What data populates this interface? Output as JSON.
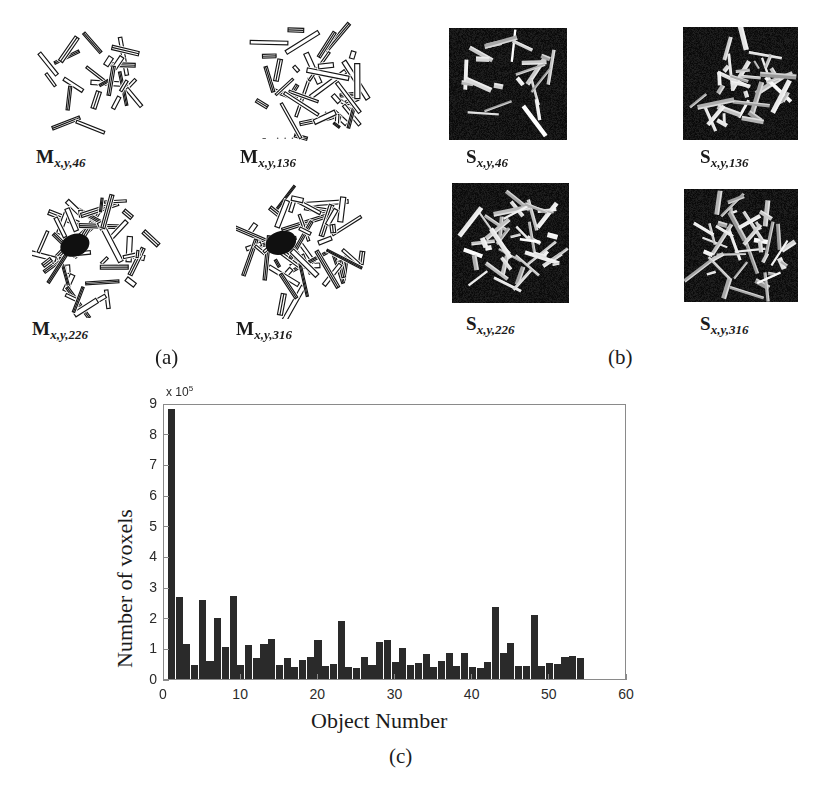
{
  "figure": {
    "panel_a": {
      "letter": "(a)",
      "tiles": [
        {
          "symbol": "M",
          "subscript": "x,y,46",
          "name": "mask-slice-46",
          "seed": 46,
          "density": 0.22,
          "x": 36,
          "y": 28,
          "w": 110,
          "h": 110
        },
        {
          "symbol": "M",
          "subscript": "x,y,136",
          "name": "mask-slice-136",
          "seed": 136,
          "density": 0.55,
          "x": 242,
          "y": 18,
          "w": 130,
          "h": 130
        },
        {
          "symbol": "M",
          "subscript": "x,y,226",
          "name": "mask-slice-226",
          "seed": 226,
          "density": 0.72,
          "x": 32,
          "y": 188,
          "w": 130,
          "h": 130
        },
        {
          "symbol": "M",
          "subscript": "x,y,316",
          "name": "mask-slice-316",
          "seed": 316,
          "density": 0.78,
          "x": 236,
          "y": 183,
          "w": 136,
          "h": 136
        }
      ]
    },
    "panel_b": {
      "letter": "(b)",
      "tiles": [
        {
          "symbol": "S",
          "subscript": "x,y,46",
          "name": "seg-slice-46",
          "seed": 460,
          "density": 0.18,
          "x": 449,
          "y": 28,
          "w": 118,
          "h": 112
        },
        {
          "symbol": "S",
          "subscript": "x,y,136",
          "name": "seg-slice-136",
          "seed": 1360,
          "density": 0.5,
          "x": 683,
          "y": 27,
          "w": 115,
          "h": 113
        },
        {
          "symbol": "S",
          "subscript": "x,y,226",
          "name": "seg-slice-226",
          "seed": 2260,
          "density": 0.66,
          "x": 452,
          "y": 183,
          "w": 117,
          "h": 120
        },
        {
          "symbol": "S",
          "subscript": "x,y,316",
          "name": "seg-slice-316",
          "seed": 3160,
          "density": 0.62,
          "x": 684,
          "y": 189,
          "w": 114,
          "h": 113
        }
      ]
    },
    "panel_c": {
      "letter": "(c)"
    }
  },
  "chart_data": {
    "type": "bar",
    "title": "",
    "xlabel": "Object Number",
    "ylabel": "Number of voxels",
    "y_exponent_label": "x 10",
    "y_exponent": "5",
    "xlim": [
      0,
      60
    ],
    "ylim": [
      0,
      9
    ],
    "xticks": [
      0,
      10,
      20,
      30,
      40,
      50,
      60
    ],
    "yticks": [
      0,
      1,
      2,
      3,
      4,
      5,
      6,
      7,
      8,
      9
    ],
    "grid": false,
    "legend": "none",
    "bar_color": "#2a2a2a",
    "units": "1e5 voxels",
    "x": [
      1,
      2,
      3,
      4,
      5,
      6,
      7,
      8,
      9,
      10,
      11,
      12,
      13,
      14,
      15,
      16,
      17,
      18,
      19,
      20,
      21,
      22,
      23,
      24,
      25,
      26,
      27,
      28,
      29,
      30,
      31,
      32,
      33,
      34,
      35,
      36,
      37,
      38,
      39,
      40,
      41,
      42,
      43,
      44,
      45,
      46,
      47,
      48,
      49,
      50,
      51,
      52,
      53,
      54
    ],
    "values": [
      8.8,
      2.67,
      1.13,
      0.46,
      2.57,
      0.58,
      2.0,
      1.03,
      2.71,
      0.45,
      1.1,
      0.7,
      1.15,
      1.31,
      0.46,
      0.67,
      0.38,
      0.62,
      0.73,
      1.26,
      0.42,
      0.5,
      1.88,
      0.4,
      0.37,
      0.72,
      0.46,
      1.2,
      1.27,
      0.57,
      1.01,
      0.47,
      0.51,
      0.83,
      0.4,
      0.6,
      0.86,
      0.41,
      0.86,
      0.4,
      0.37,
      0.57,
      2.35,
      0.85,
      1.18,
      0.41,
      0.43,
      2.1,
      0.42,
      0.53,
      0.48,
      0.71,
      0.76,
      0.67
    ]
  }
}
